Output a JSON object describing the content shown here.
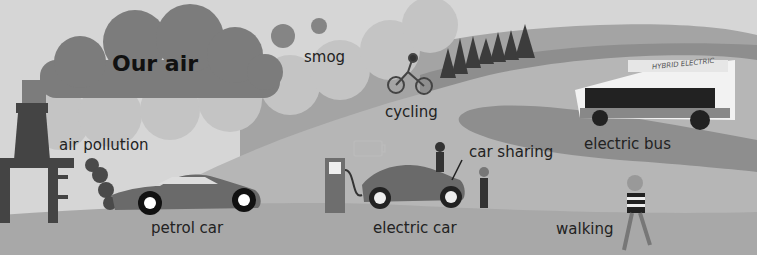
{
  "title": "Our air",
  "labels": {
    "smog": "smog",
    "cycling": "cycling",
    "air_pollution": "air pollution",
    "electric_bus": "electric bus",
    "car_sharing": "car sharing",
    "petrol_car": "petrol car",
    "electric_car": "electric car",
    "walking": "walking"
  },
  "bus_sign": "HYBRID ELECTRIC",
  "colors": {
    "sky": "#d6d6d6",
    "cloud_dark": "#7c7c7c",
    "cloud_light": "#bdbdbd",
    "hill_dark": "#8e8e8e",
    "road": "#b4b4b4",
    "ground": "#a8a8a8",
    "text": "#222222"
  }
}
